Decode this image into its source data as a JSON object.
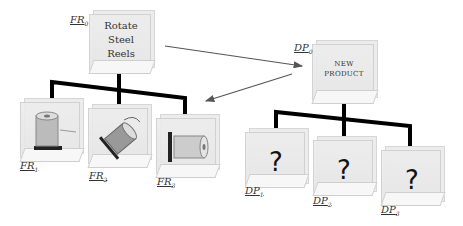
{
  "diagram": {
    "type": "axiomatic-design-decomposition",
    "functional_requirements": {
      "root": {
        "id": "FR0",
        "label_main": "FR",
        "label_sub": "0",
        "text_lines": [
          "Rotate",
          "Steel",
          "Reels"
        ]
      },
      "children": [
        {
          "id": "FR1",
          "label_main": "FR",
          "label_sub": "1",
          "image": "reel-upright-with-arrow"
        },
        {
          "id": "FR2",
          "label_main": "FR",
          "label_sub": "2",
          "image": "reel-tilted-with-rotation-arrow"
        },
        {
          "id": "FR3",
          "label_main": "FR",
          "label_sub": "3",
          "image": "reel-horizontal-on-stand"
        }
      ]
    },
    "design_parameters": {
      "root": {
        "id": "DP0",
        "label_main": "DP",
        "label_sub": "0",
        "text_lines": [
          "NEW",
          "PRODUCT"
        ]
      },
      "children": [
        {
          "id": "DP1",
          "label_main": "DP",
          "label_sub": "1",
          "symbol": "?"
        },
        {
          "id": "DP2",
          "label_main": "DP",
          "label_sub": "2",
          "symbol": "?"
        },
        {
          "id": "DP3",
          "label_main": "DP",
          "label_sub": "3",
          "symbol": "?"
        }
      ]
    },
    "arrows": [
      {
        "from": "FR0",
        "to": "DP0",
        "meaning": "mapping"
      },
      {
        "from": "DP0",
        "to": "FR-level-1",
        "meaning": "zigzag"
      }
    ],
    "colors": {
      "tree_line": "#000000",
      "arrow": "#555555",
      "cube": "#e9e9e9"
    }
  }
}
